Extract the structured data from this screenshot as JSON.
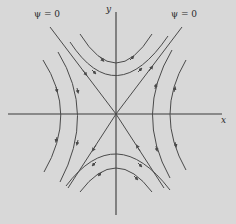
{
  "figure": {
    "type": "phase-portrait",
    "labels": {
      "psi_left": "ψ = 0",
      "psi_right": "ψ = 0",
      "y_axis": "y",
      "x_axis": "x"
    },
    "colors": {
      "background": "#d8d8d8",
      "axes": "#3a3a3a",
      "curves": "#4a4a4a"
    }
  }
}
